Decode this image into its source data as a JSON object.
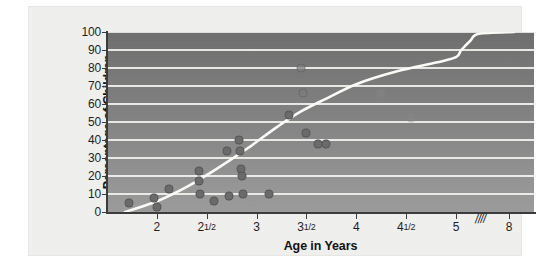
{
  "chart_data": {
    "type": "scatter",
    "title": "",
    "xlabel": "Age in Years",
    "ylabel": "Percentage of Children",
    "xlim": [
      1.5,
      8.4
    ],
    "ylim": [
      0,
      100
    ],
    "grid": true,
    "legend": "none",
    "axis_break": {
      "symbol": "////",
      "between": [
        5,
        8
      ],
      "note": "x-axis is broken between 5 and 8 years"
    },
    "x_ticks": [
      {
        "value": 2,
        "label": "2"
      },
      {
        "value": 2.5,
        "label": "2½"
      },
      {
        "value": 3,
        "label": "3"
      },
      {
        "value": 3.5,
        "label": "3½"
      },
      {
        "value": 4,
        "label": "4"
      },
      {
        "value": 4.5,
        "label": "4½"
      },
      {
        "value": 5,
        "label": "5"
      },
      {
        "value": 8,
        "label": "8"
      }
    ],
    "y_ticks": [
      0,
      10,
      20,
      30,
      40,
      50,
      60,
      70,
      80,
      90,
      100
    ],
    "points": [
      {
        "x": 1.72,
        "y": 5
      },
      {
        "x": 1.97,
        "y": 8
      },
      {
        "x": 2.0,
        "y": 3
      },
      {
        "x": 2.12,
        "y": 13
      },
      {
        "x": 2.42,
        "y": 23
      },
      {
        "x": 2.42,
        "y": 17
      },
      {
        "x": 2.43,
        "y": 10
      },
      {
        "x": 2.57,
        "y": 6
      },
      {
        "x": 2.7,
        "y": 34
      },
      {
        "x": 2.72,
        "y": 9
      },
      {
        "x": 2.82,
        "y": 40
      },
      {
        "x": 2.83,
        "y": 34
      },
      {
        "x": 2.84,
        "y": 24
      },
      {
        "x": 2.85,
        "y": 20
      },
      {
        "x": 2.86,
        "y": 10
      },
      {
        "x": 3.12,
        "y": 10
      },
      {
        "x": 3.33,
        "y": 54
      },
      {
        "x": 3.45,
        "y": 80
      },
      {
        "x": 3.47,
        "y": 66
      },
      {
        "x": 3.5,
        "y": 44
      },
      {
        "x": 3.62,
        "y": 38
      },
      {
        "x": 3.7,
        "y": 38
      },
      {
        "x": 4.25,
        "y": 66
      },
      {
        "x": 4.55,
        "y": 52
      }
    ],
    "curve": [
      {
        "x": 1.68,
        "y": 0
      },
      {
        "x": 2.0,
        "y": 6
      },
      {
        "x": 2.3,
        "y": 14
      },
      {
        "x": 2.6,
        "y": 24
      },
      {
        "x": 2.9,
        "y": 35
      },
      {
        "x": 3.2,
        "y": 47
      },
      {
        "x": 3.45,
        "y": 56
      },
      {
        "x": 3.7,
        "y": 63
      },
      {
        "x": 4.0,
        "y": 71
      },
      {
        "x": 4.4,
        "y": 78
      },
      {
        "x": 4.8,
        "y": 83
      },
      {
        "x": 5.0,
        "y": 86
      },
      {
        "x": 5.3,
        "y": 90
      },
      {
        "x": 5.8,
        "y": 95
      },
      {
        "x": 6.3,
        "y": 99
      },
      {
        "x": 8.3,
        "y": 100
      }
    ],
    "series_name": "Percentage of children"
  },
  "colors": {
    "plot_top": "#6e6e6e",
    "plot_bottom": "#9b9b9b",
    "gridline": "#f2f2ef",
    "curve": "#fbfbf8",
    "dot": "#6a6a6a",
    "paper": "#f0f0ef",
    "text": "#1d1d1d"
  }
}
